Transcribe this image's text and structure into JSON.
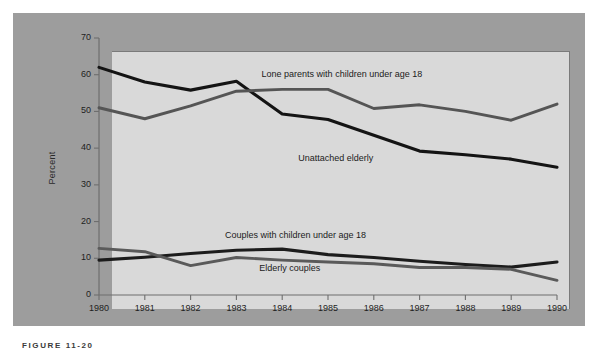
{
  "figure": {
    "caption": "FIGURE 11-20",
    "panel_color": "#9d9d9d",
    "plot_bg_color": "#d9d9d9"
  },
  "chart_data": {
    "type": "line",
    "title": "",
    "subtitle": "",
    "xlabel": "",
    "ylabel": "Percent",
    "x": [
      1980,
      1981,
      1982,
      1983,
      1984,
      1985,
      1986,
      1987,
      1988,
      1989,
      1990
    ],
    "categories": [
      "1980",
      "1981",
      "1982",
      "1983",
      "1984",
      "1985",
      "1986",
      "1987",
      "1988",
      "1989",
      "1990"
    ],
    "xlim": [
      1980,
      1990
    ],
    "ylim": [
      0,
      70
    ],
    "yticks": [
      0,
      10,
      20,
      30,
      40,
      50,
      60,
      70
    ],
    "ytick_labels": [
      "0",
      "10",
      "20",
      "30",
      "40",
      "50",
      "60",
      "70"
    ],
    "grid": false,
    "legend": "inline-annotations",
    "series": [
      {
        "name": "Unattached elderly",
        "color": "#141414",
        "values": [
          62.0,
          58.0,
          55.8,
          58.2,
          49.3,
          47.8,
          43.5,
          39.2,
          38.2,
          37.0,
          34.8
        ],
        "label_x": 1984.35,
        "label_y": 37.0
      },
      {
        "name": "Lone parents with children under age 18",
        "color": "#555555",
        "values": [
          51.0,
          48.0,
          51.5,
          55.5,
          56.0,
          56.0,
          50.8,
          51.8,
          50.0,
          47.6,
          52.0
        ],
        "label_x": 1983.55,
        "label_y": 60.0
      },
      {
        "name": "Couples with children under age 18",
        "color": "#1c1c1c",
        "values": [
          9.5,
          10.3,
          11.3,
          12.2,
          12.5,
          11.0,
          10.2,
          9.2,
          8.3,
          7.6,
          9.0
        ],
        "label_x": 1982.75,
        "label_y": 16.0
      },
      {
        "name": "Elderly couples",
        "color": "#5a5a5a",
        "values": [
          12.7,
          11.8,
          8.0,
          10.2,
          9.5,
          9.0,
          8.5,
          7.5,
          7.5,
          7.0,
          4.0
        ],
        "label_x": 1983.5,
        "label_y": 7.0
      }
    ],
    "annotations": [
      "Lone parents with children under age 18",
      "Unattached elderly",
      "Couples with children under age 18",
      "Elderly couples"
    ]
  }
}
